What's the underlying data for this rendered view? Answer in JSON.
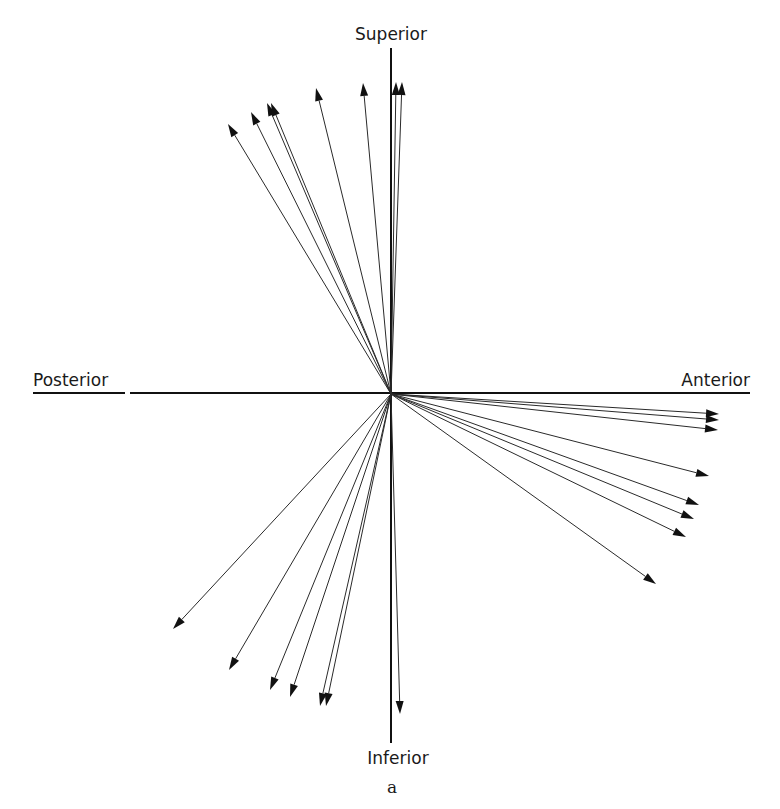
{
  "figure": {
    "panel_label": "a",
    "axes": {
      "top_label": "Superior",
      "bottom_label": "Inferior",
      "left_label": "Posterior",
      "right_label": "Anterior",
      "origin": [
        391,
        394
      ],
      "horizontal": {
        "x1": 33,
        "x2": 750,
        "y": 393,
        "gap": [
          125,
          130
        ]
      },
      "vertical": {
        "x": 391,
        "y1": 48,
        "y2": 743
      }
    },
    "colors": {
      "line": "#111111",
      "vector": "#2a2a2a",
      "background": "#ffffff"
    },
    "vectors": [
      {
        "group": "superior-posterior",
        "tip": [
          228,
          124
        ]
      },
      {
        "group": "superior-posterior",
        "tip": [
          251,
          112
        ]
      },
      {
        "group": "superior-posterior",
        "tip": [
          267,
          103
        ]
      },
      {
        "group": "superior-posterior",
        "tip": [
          271,
          103
        ]
      },
      {
        "group": "superior-posterior",
        "tip": [
          316,
          88
        ]
      },
      {
        "group": "superior-posterior",
        "tip": [
          363,
          83
        ]
      },
      {
        "group": "superior",
        "tip": [
          396,
          82
        ]
      },
      {
        "group": "superior",
        "tip": [
          402,
          82
        ]
      },
      {
        "group": "anterior-inferior",
        "tip": [
          719,
          414
        ]
      },
      {
        "group": "anterior-inferior",
        "tip": [
          719,
          420
        ]
      },
      {
        "group": "anterior-inferior",
        "tip": [
          718,
          430
        ]
      },
      {
        "group": "anterior-inferior",
        "tip": [
          709,
          476
        ]
      },
      {
        "group": "anterior-inferior",
        "tip": [
          699,
          505
        ]
      },
      {
        "group": "anterior-inferior",
        "tip": [
          694,
          519
        ]
      },
      {
        "group": "anterior-inferior",
        "tip": [
          686,
          537
        ]
      },
      {
        "group": "anterior-inferior",
        "tip": [
          656,
          584
        ]
      },
      {
        "group": "posterior-inferior",
        "tip": [
          173,
          629
        ]
      },
      {
        "group": "posterior-inferior",
        "tip": [
          229,
          670
        ]
      },
      {
        "group": "posterior-inferior",
        "tip": [
          270,
          690
        ]
      },
      {
        "group": "posterior-inferior",
        "tip": [
          290,
          697
        ]
      },
      {
        "group": "posterior-inferior",
        "tip": [
          320,
          706
        ]
      },
      {
        "group": "posterior-inferior",
        "tip": [
          326,
          706
        ]
      },
      {
        "group": "inferior",
        "tip": [
          400,
          714
        ]
      }
    ]
  }
}
